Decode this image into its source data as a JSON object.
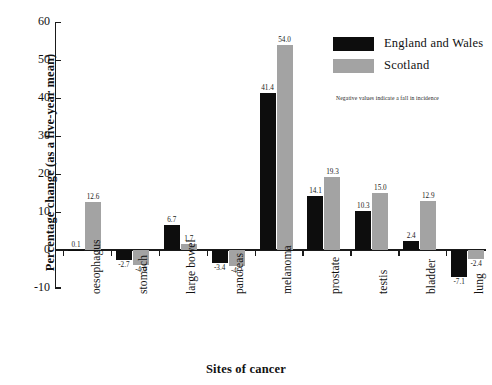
{
  "chart_data": {
    "type": "bar",
    "title": "",
    "xlabel": "Sites of cancer",
    "ylabel": "Percentage change (as a five-year mean)",
    "ylim": [
      -10,
      60
    ],
    "yticks": [
      -10,
      0,
      10,
      20,
      30,
      40,
      50,
      60
    ],
    "ytick_labels": [
      "-10",
      "0",
      "10",
      "20",
      "30",
      "40",
      "50",
      "60"
    ],
    "grid": false,
    "legend_position": "upper right",
    "categories": [
      "oesophagus",
      "stomach",
      "large bowel",
      "pancreas",
      "melanoma",
      "prostate",
      "testis",
      "bladder",
      "lung"
    ],
    "series": [
      {
        "name": "England and Wales",
        "color": "#0d0d0d",
        "values": [
          0.1,
          -2.7,
          6.7,
          -3.4,
          41.4,
          14.1,
          10.3,
          2.4,
          -7.1
        ],
        "labels": [
          "0.1",
          "-2.7",
          "6.7",
          "-3.4",
          "41.4",
          "14.1",
          "10.3",
          "2.4",
          "-7.1"
        ]
      },
      {
        "name": "Scotland",
        "color": "#a3a3a3",
        "values": [
          12.6,
          -4.0,
          1.7,
          -4.2,
          54.0,
          19.3,
          15.0,
          12.9,
          -2.4
        ],
        "labels": [
          "12.6",
          "-4.0",
          "1.7",
          "-4.2",
          "54.0",
          "19.3",
          "15.0",
          "12.9",
          "-2.4"
        ]
      }
    ],
    "annotation": "Negative values indicate a fall in incidence"
  },
  "legend": {
    "items": [
      {
        "label": "England and Wales",
        "color": "#0d0d0d"
      },
      {
        "label": "Scotland",
        "color": "#a3a3a3"
      }
    ]
  }
}
